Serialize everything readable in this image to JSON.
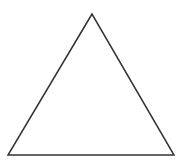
{
  "diagram": {
    "shape": "triangle",
    "type": "equilateral-outline",
    "stroke_color": "#333333",
    "fill_color": "#ffffff",
    "stroke_width": 1.5,
    "vertices": {
      "apex": [
        92,
        14
      ],
      "bottom_left": [
        8,
        155
      ],
      "bottom_right": [
        174,
        155
      ]
    }
  }
}
